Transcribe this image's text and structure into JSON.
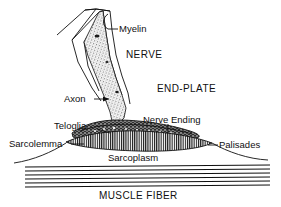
{
  "figure": {
    "background_color": "#ffffff",
    "ink_color": "#101010",
    "labels": {
      "myelin": "Myelin",
      "nerve": "NERVE",
      "end_plate": "END-PLATE",
      "axon": "Axon",
      "nerve_ending": "Nerve Ending",
      "teloglia": "Teloglia",
      "sarcolemma": "Sarcolemma",
      "palisades": "Palisades",
      "sarcoplasm": "Sarcoplasm",
      "muscle_fiber": "MUSCLE FIBER"
    },
    "parts": [
      {
        "key": "myelin",
        "label": "Myelin",
        "style": "leader-line",
        "kind": "sheath"
      },
      {
        "key": "nerve",
        "label": "NERVE",
        "style": "free-caps",
        "kind": "region"
      },
      {
        "key": "end_plate",
        "label": "END-PLATE",
        "style": "free-caps",
        "kind": "region"
      },
      {
        "key": "axon",
        "label": "Axon",
        "style": "leader-line",
        "kind": "stippled-fiber"
      },
      {
        "key": "nerve_ending",
        "label": "Nerve Ending",
        "style": "leader-line",
        "kind": "terminal-bouton"
      },
      {
        "key": "teloglia",
        "label": "Teloglia",
        "style": "leader-line",
        "kind": "glial-cap"
      },
      {
        "key": "sarcolemma",
        "label": "Sarcolemma",
        "style": "leader-line",
        "kind": "membrane"
      },
      {
        "key": "palisades",
        "label": "Palisades",
        "style": "leader-line",
        "kind": "junctional-folds"
      },
      {
        "key": "sarcoplasm",
        "label": "Sarcoplasm",
        "style": "free-text",
        "kind": "region"
      },
      {
        "key": "muscle_fiber",
        "label": "MUSCLE FIBER",
        "style": "free-caps",
        "kind": "region"
      }
    ],
    "muscle_striation_count": 6
  }
}
